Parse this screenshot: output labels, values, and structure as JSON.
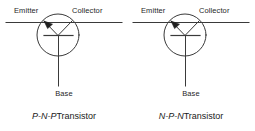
{
  "figure": {
    "background_color": "#ffffff",
    "line_color": "#3a3a3a",
    "text_color": "#1a1a1a"
  },
  "diagrams": [
    {
      "id": "pnp",
      "terminals": {
        "emitter_label": "Emitter",
        "collector_label": "Collector",
        "base_label": "Base"
      },
      "caption": {
        "type": "P-N-P",
        "suffix": "Transistor"
      },
      "arrow_direction": "inward",
      "arrow_on": "emitter"
    },
    {
      "id": "npn",
      "terminals": {
        "emitter_label": "Emitter",
        "collector_label": "Collector",
        "base_label": "Base"
      },
      "caption": {
        "type": "N-P-N",
        "suffix": "Transistor"
      },
      "arrow_direction": "inward",
      "arrow_on": "emitter"
    }
  ]
}
